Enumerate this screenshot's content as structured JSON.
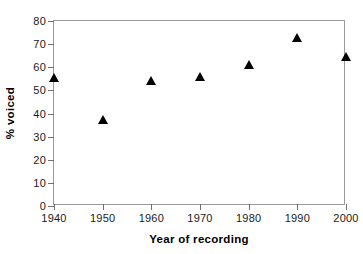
{
  "chart_data": {
    "type": "scatter",
    "title": "",
    "xlabel": "Year of recording",
    "ylabel": "% voiced",
    "x": [
      1940,
      1950,
      1960,
      1970,
      1980,
      1990,
      2000
    ],
    "values": [
      55.4,
      37.0,
      54.0,
      55.7,
      61.0,
      72.6,
      64.5
    ],
    "series": [
      {
        "name": "% voiced",
        "marker": "filled-triangle",
        "color": "#000000",
        "values": [
          55.4,
          37.0,
          54.0,
          55.7,
          61.0,
          72.6,
          64.5
        ]
      }
    ],
    "xlim": [
      1940,
      2000
    ],
    "ylim": [
      0,
      80
    ],
    "xticks": [
      1940,
      1950,
      1960,
      1970,
      1980,
      1990,
      2000
    ],
    "yticks": [
      0,
      10,
      20,
      30,
      40,
      50,
      60,
      70,
      80
    ],
    "xtick_labels": [
      "1940",
      "1950",
      "1960",
      "1970",
      "1980",
      "1990",
      "2000"
    ],
    "ytick_labels": [
      "0",
      "10",
      "20",
      "30",
      "40",
      "50",
      "60",
      "70",
      "80"
    ],
    "grid": false,
    "legend": false,
    "legend_position": "none",
    "background": "#ffffff",
    "frame_color": "#9a9a9a"
  }
}
